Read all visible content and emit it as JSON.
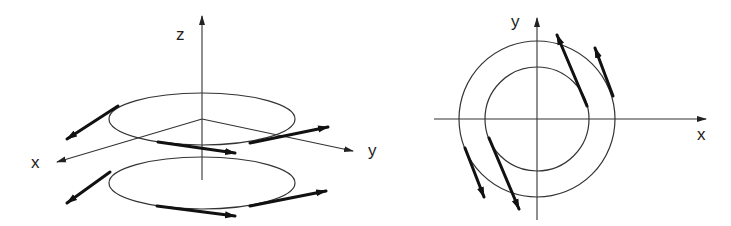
{
  "figure": {
    "colors": {
      "line": "#333333",
      "arrow": "#111111",
      "background": "#ffffff"
    },
    "left_panel": {
      "description": "3D view: two horizontal loops stacked along z axis with tangential velocity arrows",
      "axis_labels": {
        "z": "z",
        "x": "x",
        "y": "y"
      },
      "origin": [
        202,
        119
      ],
      "axes": {
        "z": {
          "from": [
            202,
            180
          ],
          "to": [
            202,
            16
          ]
        },
        "x": {
          "from": [
            202,
            119
          ],
          "to": [
            57,
            162
          ]
        },
        "y": {
          "from": [
            202,
            119
          ],
          "to": [
            353,
            151
          ]
        }
      },
      "label_positions": {
        "z": [
          176,
          40
        ],
        "x": [
          31,
          168
        ],
        "y": [
          368,
          156
        ]
      },
      "loops": [
        {
          "name": "upper-loop",
          "cx": 202,
          "cy": 119,
          "rx": 93,
          "ry": 26,
          "arrows": [
            {
              "from": [
                118,
                106
              ],
              "to": [
                67,
                139
              ]
            },
            {
              "from": [
                158,
                142
              ],
              "to": [
                235,
                153
              ]
            },
            {
              "from": [
                250,
                143
              ],
              "to": [
                328,
                127
              ]
            }
          ]
        },
        {
          "name": "lower-loop",
          "cx": 202,
          "cy": 183,
          "rx": 93,
          "ry": 26,
          "arrows": [
            {
              "from": [
                110,
                172
              ],
              "to": [
                67,
                203
              ]
            },
            {
              "from": [
                157,
                206
              ],
              "to": [
                235,
                216
              ]
            },
            {
              "from": [
                250,
                206
              ],
              "to": [
                326,
                191
              ]
            }
          ]
        }
      ]
    },
    "right_panel": {
      "description": "Top view: two concentric circles with velocity arrows",
      "axis_labels": {
        "x": "x",
        "y": "y"
      },
      "center": [
        537,
        119
      ],
      "axes": {
        "x": {
          "from": [
            434,
            119
          ],
          "to": [
            706,
            119
          ]
        },
        "y": {
          "from": [
            537,
            220
          ],
          "to": [
            537,
            18
          ]
        }
      },
      "label_positions": {
        "x": [
          697,
          140
        ],
        "y": [
          511,
          27
        ]
      },
      "circles": [
        {
          "name": "outer-circle",
          "r": 78
        },
        {
          "name": "inner-circle",
          "r": 52
        }
      ],
      "arrows": [
        {
          "name": "arrow-upper-right-long",
          "from": [
            587,
            106
          ],
          "to": [
            557,
            35
          ]
        },
        {
          "name": "arrow-upper-right-short",
          "from": [
            613,
            96
          ],
          "to": [
            595,
            48
          ]
        },
        {
          "name": "arrow-lower-left-long",
          "from": [
            489,
            138
          ],
          "to": [
            519,
            209
          ]
        },
        {
          "name": "arrow-lower-left-short",
          "from": [
            465,
            148
          ],
          "to": [
            484,
            197
          ]
        }
      ]
    }
  }
}
